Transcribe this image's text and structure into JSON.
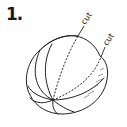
{
  "step": {
    "number": "1."
  },
  "illustration": {
    "subject": "segmented-sphere",
    "cut_labels": [
      "cut",
      "cut"
    ],
    "stroke_color": "#222222",
    "background": "#ffffff"
  }
}
